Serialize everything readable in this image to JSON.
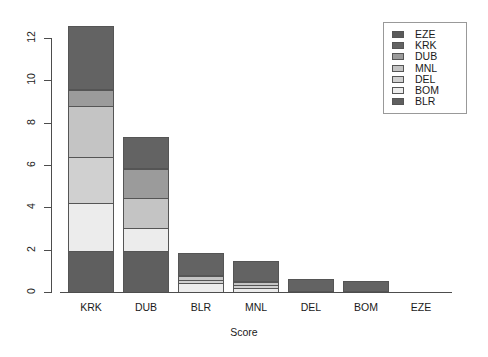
{
  "chart_data": {
    "type": "bar",
    "subtype": "stacked",
    "title": "",
    "xlabel": "Score",
    "ylabel": "",
    "categories": [
      "KRK",
      "DUB",
      "BLR",
      "MNL",
      "DEL",
      "BOM",
      "EZE"
    ],
    "series": [
      {
        "name": "EZE",
        "color": "#5a5a5a",
        "values": [
          0,
          0,
          0,
          0,
          0,
          0,
          0
        ]
      },
      {
        "name": "KRK",
        "color": "#636363",
        "values": [
          3.0,
          1.5,
          1.1,
          1.0,
          0.6,
          0.5,
          0
        ]
      },
      {
        "name": "DUB",
        "color": "#9b9b9b",
        "values": [
          0.8,
          1.4,
          0,
          0,
          0,
          0,
          0
        ]
      },
      {
        "name": "MNL",
        "color": "#c4c4c4",
        "values": [
          2.5,
          1.5,
          0.25,
          0.15,
          0,
          0,
          0
        ]
      },
      {
        "name": "DEL",
        "color": "#d0d0d0",
        "values": [
          2.2,
          0,
          0.2,
          0.2,
          0,
          0,
          0
        ]
      },
      {
        "name": "BOM",
        "color": "#ececec",
        "values": [
          2.3,
          1.1,
          0.45,
          0.25,
          0,
          0,
          0
        ]
      },
      {
        "name": "BLR",
        "color": "#5f5f5f",
        "values": [
          2.0,
          2.0,
          0,
          0,
          0,
          0,
          0
        ]
      }
    ],
    "stack_order_bottom_to_top": [
      "BLR",
      "BOM",
      "DEL",
      "MNL",
      "DUB",
      "KRK",
      "EZE"
    ],
    "totals": [
      12.8,
      7.5,
      2.0,
      1.6,
      0.6,
      0.5,
      0
    ],
    "yticks": [
      0,
      2,
      4,
      6,
      8,
      10,
      12
    ],
    "ylim": [
      0,
      13.15
    ],
    "grid": false,
    "legend_position": "top-right",
    "legend_entries": [
      "EZE",
      "KRK",
      "DUB",
      "MNL",
      "DEL",
      "BOM",
      "BLR"
    ],
    "bar_stacks": [
      {
        "category": "KRK",
        "segments": [
          {
            "series": "BLR",
            "value": 2.0,
            "color": "#5f5f5f"
          },
          {
            "series": "BOM",
            "value": 2.3,
            "color": "#ececec"
          },
          {
            "series": "DEL",
            "value": 2.2,
            "color": "#d0d0d0"
          },
          {
            "series": "MNL",
            "value": 2.5,
            "color": "#c4c4c4"
          },
          {
            "series": "DUB",
            "value": 0.8,
            "color": "#9b9b9b"
          },
          {
            "series": "KRK",
            "value": 3.0,
            "color": "#636363"
          }
        ]
      },
      {
        "category": "DUB",
        "segments": [
          {
            "series": "BLR",
            "value": 2.0,
            "color": "#5f5f5f"
          },
          {
            "series": "BOM",
            "value": 1.1,
            "color": "#ececec"
          },
          {
            "series": "MNL",
            "value": 1.5,
            "color": "#c4c4c4"
          },
          {
            "series": "DUB",
            "value": 1.4,
            "color": "#9b9b9b"
          },
          {
            "series": "KRK",
            "value": 1.5,
            "color": "#636363"
          }
        ]
      },
      {
        "category": "BLR",
        "segments": [
          {
            "series": "BOM",
            "value": 0.45,
            "color": "#ececec"
          },
          {
            "series": "DEL",
            "value": 0.2,
            "color": "#d0d0d0"
          },
          {
            "series": "MNL",
            "value": 0.25,
            "color": "#c4c4c4"
          },
          {
            "series": "KRK",
            "value": 1.1,
            "color": "#636363"
          }
        ]
      },
      {
        "category": "MNL",
        "segments": [
          {
            "series": "BOM",
            "value": 0.25,
            "color": "#ececec"
          },
          {
            "series": "DEL",
            "value": 0.2,
            "color": "#d0d0d0"
          },
          {
            "series": "MNL",
            "value": 0.15,
            "color": "#c4c4c4"
          },
          {
            "series": "KRK",
            "value": 1.0,
            "color": "#636363"
          }
        ]
      },
      {
        "category": "DEL",
        "segments": [
          {
            "series": "KRK",
            "value": 0.6,
            "color": "#636363"
          }
        ]
      },
      {
        "category": "BOM",
        "segments": [
          {
            "series": "KRK",
            "value": 0.5,
            "color": "#636363"
          }
        ]
      },
      {
        "category": "EZE",
        "segments": []
      }
    ]
  }
}
